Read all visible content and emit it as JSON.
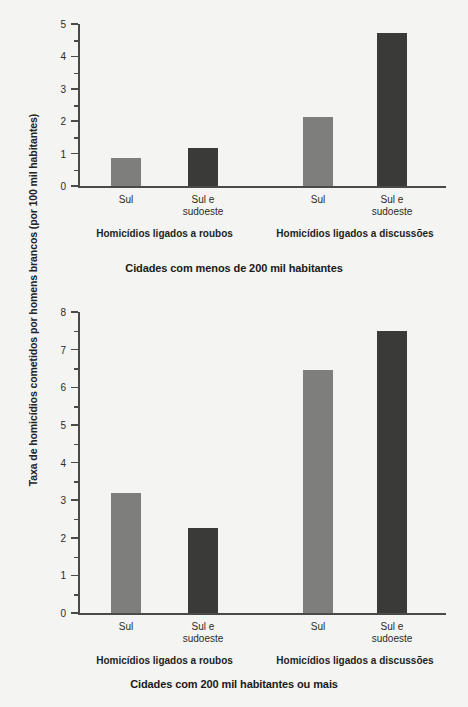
{
  "figure": {
    "y_axis_title": "Taxa de homicídios cometidos por homens brancos (por 100 mil habitantes)",
    "background_color": "#f4f4f2",
    "axis_color": "#4a4a48",
    "series_colors": {
      "sul": "#7e7e7c",
      "sul_e_sudoeste": "#3a3a38"
    }
  },
  "panels": [
    {
      "id": "panel-top",
      "caption": "Cidades com menos de 200 mil habitantes",
      "groups": [
        {
          "label": "Homicídios ligados a roubos",
          "bars": [
            {
              "category": "Sul",
              "value": 0.85,
              "color": "light"
            },
            {
              "category": "Sul e\nsudoeste",
              "value": 1.17,
              "color": "dark"
            }
          ]
        },
        {
          "label": "Homicídios ligados a discussões",
          "bars": [
            {
              "category": "Sul",
              "value": 2.13,
              "color": "light"
            },
            {
              "category": "Sul e\nsudoeste",
              "value": 4.72,
              "color": "dark"
            }
          ]
        }
      ],
      "y_ticks": [
        "0",
        "1",
        "2",
        "3",
        "4",
        "5"
      ],
      "y_max": 5
    },
    {
      "id": "panel-bottom",
      "caption": "Cidades com 200 mil habitantes ou mais",
      "groups": [
        {
          "label": "Homicídios ligados a roubos",
          "bars": [
            {
              "category": "Sul",
              "value": 3.2,
              "color": "light"
            },
            {
              "category": "Sul e\nsudoeste",
              "value": 2.25,
              "color": "dark"
            }
          ]
        },
        {
          "label": "Homicídios ligados a discussões",
          "bars": [
            {
              "category": "Sul",
              "value": 6.45,
              "color": "light"
            },
            {
              "category": "Sul e\nsudoeste",
              "value": 7.5,
              "color": "dark"
            }
          ]
        }
      ],
      "y_ticks": [
        "0",
        "1",
        "2",
        "3",
        "4",
        "5",
        "6",
        "7",
        "8"
      ],
      "y_max": 8
    }
  ],
  "chart_data": {
    "type": "bar",
    "title": "",
    "xlabel": "",
    "ylabel": "Taxa de homicídios cometidos por homens brancos (por 100 mil habitantes)",
    "grid": false,
    "legend": "none",
    "panels": [
      {
        "panel_title": "Cidades com menos de 200 mil habitantes",
        "categories": [
          "Sul",
          "Sul e sudoeste",
          "Sul",
          "Sul e sudoeste"
        ],
        "group_labels": [
          "Homicídios ligados a roubos",
          "Homicídios ligados a discussões"
        ],
        "values": [
          0.85,
          1.17,
          2.13,
          4.72
        ],
        "ylim": [
          0,
          5
        ],
        "yticks": [
          0,
          1,
          2,
          3,
          4,
          5
        ]
      },
      {
        "panel_title": "Cidades com 200 mil habitantes ou mais",
        "categories": [
          "Sul",
          "Sul e sudoeste",
          "Sul",
          "Sul e sudoeste"
        ],
        "group_labels": [
          "Homicídios ligados a roubos",
          "Homicídios ligados a discussões"
        ],
        "values": [
          3.2,
          2.25,
          6.45,
          7.5
        ],
        "ylim": [
          0,
          8
        ],
        "yticks": [
          0,
          1,
          2,
          3,
          4,
          5,
          6,
          7,
          8
        ]
      }
    ]
  }
}
